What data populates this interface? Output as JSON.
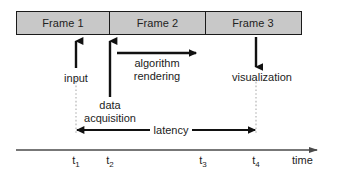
{
  "diagram": {
    "colors": {
      "frame_fill": "#c8c8c8",
      "stroke": "#1a1a1a",
      "text": "#1c1c1c",
      "dotted_guide": "#b0b0b0",
      "axis": "#5a5a5a"
    },
    "frames": [
      {
        "label": "Frame 1"
      },
      {
        "label": "Frame 2"
      },
      {
        "label": "Frame 3"
      }
    ],
    "annotations": {
      "input": "input",
      "data_acquisition_line1": "data",
      "data_acquisition_line2": "acquisition",
      "algorithm": "algorithm",
      "rendering": "rendering",
      "visualization": "visualization",
      "latency": "latency"
    },
    "axis": {
      "name": "time",
      "ticks": [
        {
          "base": "t",
          "sub": "1"
        },
        {
          "base": "t",
          "sub": "2"
        },
        {
          "base": "t",
          "sub": "3"
        },
        {
          "base": "t",
          "sub": "4"
        }
      ]
    }
  }
}
